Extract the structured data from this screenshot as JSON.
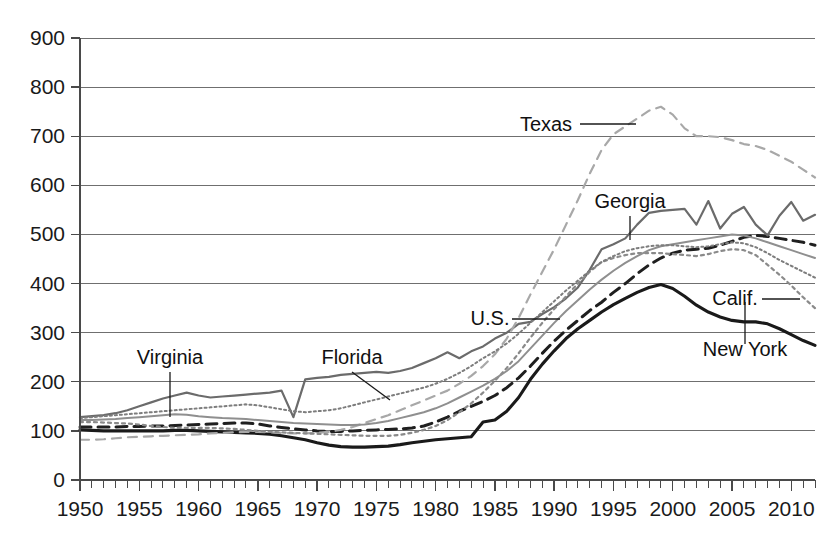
{
  "chart_data": {
    "type": "line",
    "title": "",
    "subtitle": "",
    "xlabel": "",
    "ylabel": "",
    "xlim": [
      1950,
      2012
    ],
    "ylim": [
      0,
      900
    ],
    "ytick_step": 100,
    "xtick_step": 5,
    "minor_xtick_step": 1,
    "grid": "horizontal",
    "legend_position": "inline-annotations",
    "ytick_labels": [
      "0",
      "100",
      "200",
      "300",
      "400",
      "500",
      "600",
      "700",
      "800",
      "900"
    ],
    "ytick_values": [
      0,
      100,
      200,
      300,
      400,
      500,
      600,
      700,
      800,
      900
    ],
    "xtick_labels": [
      "1950",
      "1955",
      "1960",
      "1965",
      "1970",
      "1975",
      "1980",
      "1985",
      "1990",
      "1995",
      "2000",
      "2005",
      "2010"
    ],
    "xtick_values": [
      1950,
      1955,
      1960,
      1965,
      1970,
      1975,
      1980,
      1985,
      1990,
      1995,
      2000,
      2005,
      2010
    ],
    "x": [
      1950,
      1951,
      1952,
      1953,
      1954,
      1955,
      1956,
      1957,
      1958,
      1959,
      1960,
      1961,
      1962,
      1963,
      1964,
      1965,
      1966,
      1967,
      1968,
      1969,
      1970,
      1971,
      1972,
      1973,
      1974,
      1975,
      1976,
      1977,
      1978,
      1979,
      1980,
      1981,
      1982,
      1983,
      1984,
      1985,
      1986,
      1987,
      1988,
      1989,
      1990,
      1991,
      1992,
      1993,
      1994,
      1995,
      1996,
      1997,
      1998,
      1999,
      2000,
      2001,
      2002,
      2003,
      2004,
      2005,
      2006,
      2007,
      2008,
      2009,
      2010,
      2011,
      2012
    ],
    "series": [
      {
        "name": "New York",
        "style": "solid",
        "color": "#1a1a1a",
        "width": 3.1,
        "values": [
          102,
          101,
          100,
          100,
          100,
          100,
          100,
          100,
          101,
          101,
          100,
          99,
          98,
          97,
          96,
          95,
          93,
          90,
          86,
          82,
          76,
          71,
          68,
          67,
          67,
          68,
          69,
          72,
          76,
          79,
          82,
          84,
          86,
          88,
          118,
          122,
          140,
          168,
          205,
          236,
          263,
          288,
          308,
          325,
          342,
          357,
          370,
          382,
          392,
          398,
          390,
          374,
          356,
          342,
          332,
          325,
          322,
          322,
          318,
          308,
          296,
          284,
          274
        ]
      },
      {
        "name": "U.S.",
        "style": "dashed-bold",
        "color": "#1f1f1f",
        "width": 3.0,
        "values": [
          108,
          108,
          108,
          108,
          109,
          109,
          110,
          110,
          111,
          112,
          113,
          114,
          115,
          116,
          116,
          114,
          110,
          107,
          104,
          102,
          100,
          99,
          99,
          100,
          101,
          102,
          103,
          104,
          106,
          110,
          118,
          128,
          140,
          150,
          160,
          172,
          188,
          208,
          232,
          258,
          283,
          305,
          325,
          345,
          362,
          382,
          400,
          420,
          438,
          452,
          462,
          468,
          470,
          472,
          478,
          486,
          494,
          498,
          496,
          492,
          488,
          484,
          478
        ]
      },
      {
        "name": "Georgia",
        "style": "solid",
        "color": "#6b6b6b",
        "width": 2.2,
        "values": [
          128,
          130,
          132,
          136,
          142,
          150,
          158,
          166,
          172,
          178,
          172,
          168,
          170,
          172,
          174,
          176,
          178,
          182,
          128,
          205,
          208,
          210,
          214,
          216,
          218,
          220,
          218,
          222,
          228,
          238,
          248,
          260,
          248,
          262,
          272,
          288,
          300,
          318,
          322,
          338,
          352,
          370,
          392,
          428,
          470,
          480,
          492,
          520,
          544,
          548,
          550,
          552,
          520,
          568,
          512,
          542,
          556,
          520,
          498,
          538,
          566,
          528,
          540
        ]
      },
      {
        "name": "Texas",
        "style": "dashed-light",
        "color": "#a8a8a8",
        "width": 2.2,
        "values": [
          82,
          82,
          83,
          85,
          87,
          88,
          89,
          90,
          91,
          92,
          93,
          95,
          96,
          97,
          98,
          98,
          97,
          96,
          95,
          95,
          96,
          98,
          102,
          108,
          116,
          124,
          132,
          142,
          152,
          162,
          172,
          182,
          196,
          212,
          232,
          256,
          288,
          330,
          378,
          424,
          470,
          520,
          570,
          624,
          672,
          704,
          720,
          736,
          752,
          760,
          744,
          716,
          700,
          700,
          698,
          692,
          684,
          680,
          672,
          660,
          648,
          632,
          616
        ]
      },
      {
        "name": "California",
        "style": "dotted",
        "color": "#8a8a8a",
        "width": 2.2,
        "values": [
          118,
          118,
          117,
          116,
          115,
          113,
          110,
          108,
          106,
          106,
          106,
          106,
          105,
          104,
          102,
          100,
          98,
          97,
          96,
          95,
          94,
          93,
          92,
          91,
          90,
          90,
          90,
          92,
          96,
          102,
          110,
          122,
          138,
          156,
          178,
          202,
          228,
          258,
          290,
          320,
          348,
          374,
          400,
          424,
          444,
          452,
          458,
          462,
          462,
          462,
          460,
          458,
          456,
          460,
          466,
          470,
          468,
          458,
          438,
          418,
          396,
          372,
          350
        ]
      },
      {
        "name": "Virginia",
        "style": "solid",
        "color": "#8f8f8f",
        "width": 2.0,
        "values": [
          122,
          122,
          123,
          124,
          126,
          128,
          130,
          132,
          134,
          133,
          130,
          128,
          126,
          125,
          124,
          122,
          120,
          118,
          116,
          115,
          114,
          113,
          112,
          112,
          113,
          116,
          120,
          126,
          132,
          138,
          146,
          156,
          168,
          180,
          192,
          206,
          222,
          242,
          268,
          294,
          320,
          344,
          366,
          388,
          408,
          426,
          442,
          456,
          468,
          476,
          480,
          484,
          488,
          492,
          496,
          500,
          498,
          492,
          484,
          476,
          468,
          460,
          452
        ]
      },
      {
        "name": "Florida",
        "style": "dotted-fine",
        "color": "#7d7d7d",
        "width": 2.0,
        "values": [
          126,
          128,
          130,
          132,
          134,
          136,
          138,
          140,
          142,
          144,
          146,
          148,
          150,
          152,
          154,
          152,
          148,
          144,
          140,
          138,
          140,
          142,
          146,
          152,
          158,
          164,
          170,
          176,
          182,
          188,
          196,
          206,
          218,
          232,
          248,
          262,
          278,
          298,
          320,
          342,
          364,
          386,
          406,
          426,
          444,
          456,
          466,
          472,
          476,
          478,
          478,
          476,
          474,
          476,
          480,
          484,
          482,
          474,
          462,
          448,
          436,
          424,
          412
        ]
      }
    ],
    "annotations": [
      {
        "text": "Virginia",
        "x_px": 170,
        "y_px": 364,
        "anchor": "middle",
        "leader": "vertical",
        "lx1": 170,
        "ly1": 372,
        "lx2": 170,
        "ly2": 417
      },
      {
        "text": "Florida",
        "x_px": 352,
        "y_px": 364,
        "anchor": "middle",
        "leader": "diagonal",
        "lx1": 352,
        "ly1": 372,
        "lx2": 390,
        "ly2": 400
      },
      {
        "text": "Texas",
        "x_px": 546,
        "y_px": 131,
        "anchor": "middle",
        "leader": "horizontal",
        "lx1": 580,
        "ly1": 124,
        "lx2": 636,
        "ly2": 124
      },
      {
        "text": "Georgia",
        "x_px": 630,
        "y_px": 208,
        "anchor": "middle",
        "leader": "vertical",
        "lx1": 630,
        "ly1": 216,
        "lx2": 630,
        "ly2": 240
      },
      {
        "text": "U.S.",
        "x_px": 490,
        "y_px": 325,
        "anchor": "middle",
        "leader": "horizontal",
        "lx1": 512,
        "ly1": 319,
        "lx2": 560,
        "ly2": 319
      },
      {
        "text": "Calif.",
        "x_px": 735,
        "y_px": 305,
        "anchor": "middle",
        "leader": "horizontal",
        "lx1": 762,
        "ly1": 299,
        "lx2": 800,
        "ly2": 299
      },
      {
        "text": "New York",
        "x_px": 745,
        "y_px": 356,
        "anchor": "middle",
        "leader": "vertical",
        "lx1": 745,
        "ly1": 344,
        "lx2": 745,
        "ly2": 302
      }
    ]
  }
}
